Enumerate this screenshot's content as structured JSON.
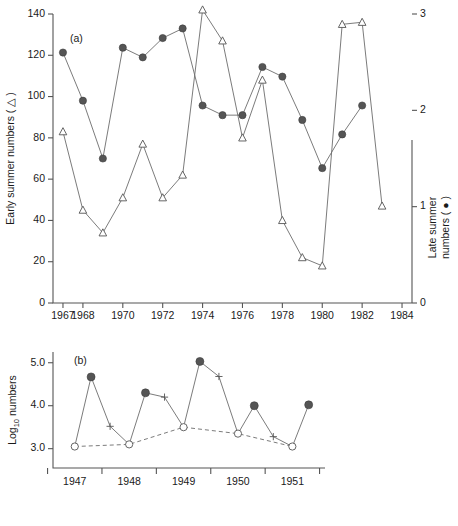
{
  "figure": {
    "caption_a": "(a)",
    "caption_b": "(b)"
  },
  "chart_data": [
    {
      "id": "panel-a",
      "type": "line",
      "title": "(a)",
      "xlabel": "",
      "ylabel": "Early summer numbers ( △ )",
      "y2label": "Late summer numbers ( ● )",
      "xlim": [
        1966.5,
        1984.5
      ],
      "ylim": [
        0,
        140
      ],
      "y2lim": [
        0,
        3
      ],
      "xticks": [
        1967,
        1968,
        1970,
        1972,
        1974,
        1976,
        1978,
        1980,
        1982,
        1984
      ],
      "xticklabels": [
        "1967",
        "1968",
        "1970",
        "1972",
        "1974",
        "1976",
        "1978",
        "1980",
        "1982",
        "1984"
      ],
      "yticks": [
        0,
        20,
        40,
        60,
        80,
        100,
        120,
        140
      ],
      "yticklabels": [
        "0",
        "20",
        "40",
        "60",
        "80",
        "100",
        "120",
        "140"
      ],
      "y2ticks": [
        0,
        1,
        2,
        3
      ],
      "y2ticklabels": [
        "0",
        "1",
        "2",
        "3"
      ],
      "grid": false,
      "legend": "none",
      "series": [
        {
          "name": "Early summer numbers",
          "marker": "open-triangle",
          "axis": "left",
          "x": [
            1967,
            1968,
            1969,
            1970,
            1971,
            1972,
            1973,
            1974,
            1975,
            1976,
            1977,
            1978,
            1979,
            1980,
            1981,
            1982,
            1983
          ],
          "values": [
            83,
            45,
            34,
            51,
            77,
            51,
            62,
            142,
            127,
            80,
            108,
            40,
            22,
            18,
            135,
            136,
            47
          ]
        },
        {
          "name": "Late summer numbers",
          "marker": "filled-circle",
          "axis": "right",
          "x": [
            1967,
            1968,
            1969,
            1970,
            1971,
            1972,
            1973,
            1974,
            1975,
            1976,
            1977,
            1978,
            1979,
            1980,
            1981,
            1982
          ],
          "values": [
            2.6,
            2.1,
            1.5,
            2.65,
            2.55,
            2.75,
            2.85,
            2.05,
            1.95,
            1.95,
            2.45,
            2.35,
            1.9,
            1.4,
            1.75,
            2.05
          ]
        }
      ]
    },
    {
      "id": "panel-b",
      "type": "line",
      "title": "(b)",
      "xlabel": "",
      "ylabel": "Log10 numbers",
      "xlim": [
        1946.6,
        1951.6
      ],
      "ylim": [
        2.55,
        5.25
      ],
      "xticks": [
        1947,
        1948,
        1949,
        1950,
        1951
      ],
      "xticklabels": [
        "1947",
        "1948",
        "1949",
        "1950",
        "1951"
      ],
      "yticks": [
        3.0,
        4.0,
        5.0
      ],
      "yticklabels": [
        "3.0",
        "4.0",
        "5.0"
      ],
      "grid": false,
      "legend": "none",
      "series": [
        {
          "name": "Spring (open circle)",
          "marker": "open-circle",
          "x": [
            1947.0,
            1948.0,
            1949.0,
            1950.0,
            1951.0
          ],
          "values": [
            3.05,
            3.1,
            3.5,
            3.35,
            3.05
          ]
        },
        {
          "name": "Early summer (filled circle)",
          "marker": "filled-circle",
          "x": [
            1947.3,
            1948.3,
            1949.3,
            1950.3,
            1951.3
          ],
          "values": [
            4.67,
            4.3,
            5.03,
            4.0,
            4.02
          ]
        },
        {
          "name": "Late summer (plus)",
          "marker": "plus",
          "x": [
            1947.65,
            1948.65,
            1949.65,
            1950.65
          ],
          "values": [
            3.52,
            4.2,
            4.68,
            3.28
          ]
        }
      ],
      "connected_sequence": [
        {
          "x": 1947.0,
          "y": 3.05,
          "marker": "open-circle"
        },
        {
          "x": 1947.3,
          "y": 4.67,
          "marker": "filled-circle"
        },
        {
          "x": 1947.65,
          "y": 3.52,
          "marker": "plus"
        },
        {
          "x": 1948.0,
          "y": 3.1,
          "marker": "open-circle"
        },
        {
          "x": 1948.3,
          "y": 4.3,
          "marker": "filled-circle"
        },
        {
          "x": 1948.65,
          "y": 4.2,
          "marker": "plus"
        },
        {
          "x": 1949.0,
          "y": 3.5,
          "marker": "open-circle"
        },
        {
          "x": 1949.3,
          "y": 5.03,
          "marker": "filled-circle"
        },
        {
          "x": 1949.65,
          "y": 4.68,
          "marker": "plus"
        },
        {
          "x": 1950.0,
          "y": 3.35,
          "marker": "open-circle"
        },
        {
          "x": 1950.3,
          "y": 4.0,
          "marker": "filled-circle"
        },
        {
          "x": 1950.65,
          "y": 3.28,
          "marker": "plus"
        },
        {
          "x": 1951.0,
          "y": 3.05,
          "marker": "open-circle"
        },
        {
          "x": 1951.3,
          "y": 4.02,
          "marker": "filled-circle"
        }
      ],
      "trend_line": {
        "style": "dashed",
        "through": "open-circle",
        "x": [
          1947.0,
          1948.0,
          1949.0,
          1950.0,
          1951.0
        ],
        "values": [
          3.05,
          3.1,
          3.5,
          3.35,
          3.05
        ]
      }
    }
  ],
  "labels": {
    "y_left_a": "Early summer numbers ( △ )",
    "y_right_a_line1": "Late summer",
    "y_right_a_line2": "numbers ( ● )",
    "y_b_prefix": "Log",
    "y_b_sub": "10",
    "y_b_suffix": " numbers"
  }
}
